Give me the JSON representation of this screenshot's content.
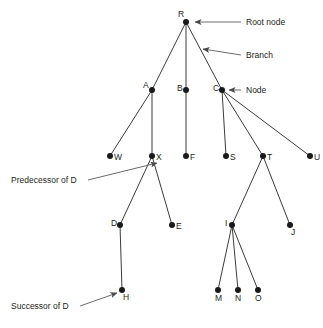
{
  "diagram": {
    "type": "tree",
    "colors": {
      "background": "#ffffff",
      "node": "#1a1a1a",
      "branch": "#3b3b3b",
      "leader": "#5a5a5a",
      "text": "#231f20"
    },
    "nodes": [
      {
        "id": "R",
        "label": "R",
        "x": 186,
        "y": 22,
        "label_dx": -8,
        "label_dy": -5,
        "role": "root"
      },
      {
        "id": "A",
        "label": "A",
        "x": 152,
        "y": 90,
        "label_dx": -9,
        "label_dy": -2,
        "role": "internal"
      },
      {
        "id": "B",
        "label": "B",
        "x": 186,
        "y": 90,
        "label_dx": -9,
        "label_dy": 1,
        "role": "internal"
      },
      {
        "id": "C",
        "label": "C",
        "x": 222,
        "y": 90,
        "label_dx": -9,
        "label_dy": 1,
        "role": "internal"
      },
      {
        "id": "W",
        "label": "W",
        "x": 110,
        "y": 156,
        "label_dx": 4,
        "label_dy": 4,
        "role": "leaf"
      },
      {
        "id": "X",
        "label": "X",
        "x": 152,
        "y": 156,
        "label_dx": 4,
        "label_dy": 4,
        "role": "internal"
      },
      {
        "id": "F",
        "label": "F",
        "x": 186,
        "y": 156,
        "label_dx": 4,
        "label_dy": 4,
        "role": "leaf"
      },
      {
        "id": "S",
        "label": "S",
        "x": 226,
        "y": 156,
        "label_dx": 4,
        "label_dy": 4,
        "role": "leaf"
      },
      {
        "id": "T",
        "label": "T",
        "x": 263,
        "y": 156,
        "label_dx": 4,
        "label_dy": 4,
        "role": "internal"
      },
      {
        "id": "U",
        "label": "U",
        "x": 310,
        "y": 156,
        "label_dx": 4,
        "label_dy": 4,
        "role": "leaf"
      },
      {
        "id": "D",
        "label": "D",
        "x": 120,
        "y": 225,
        "label_dx": -9,
        "label_dy": 1,
        "role": "internal"
      },
      {
        "id": "E",
        "label": "E",
        "x": 172,
        "y": 225,
        "label_dx": 4,
        "label_dy": 4,
        "role": "leaf"
      },
      {
        "id": "I",
        "label": "I",
        "x": 232,
        "y": 225,
        "label_dx": -7,
        "label_dy": 1,
        "role": "internal"
      },
      {
        "id": "J",
        "label": "J",
        "x": 290,
        "y": 225,
        "label_dx": 1,
        "label_dy": 10,
        "role": "leaf"
      },
      {
        "id": "H",
        "label": "H",
        "x": 122,
        "y": 290,
        "label_dx": 1,
        "label_dy": 10,
        "role": "leaf"
      },
      {
        "id": "M",
        "label": "M",
        "x": 218,
        "y": 290,
        "label_dx": -3,
        "label_dy": 11,
        "role": "leaf"
      },
      {
        "id": "N",
        "label": "N",
        "x": 238,
        "y": 290,
        "label_dx": -3,
        "label_dy": 11,
        "role": "leaf"
      },
      {
        "id": "O",
        "label": "O",
        "x": 258,
        "y": 290,
        "label_dx": -3,
        "label_dy": 11,
        "role": "leaf"
      }
    ],
    "edges": [
      {
        "from": "R",
        "to": "A"
      },
      {
        "from": "R",
        "to": "B"
      },
      {
        "from": "R",
        "to": "C"
      },
      {
        "from": "A",
        "to": "W"
      },
      {
        "from": "A",
        "to": "X"
      },
      {
        "from": "B",
        "to": "F"
      },
      {
        "from": "C",
        "to": "S"
      },
      {
        "from": "C",
        "to": "T"
      },
      {
        "from": "C",
        "to": "U"
      },
      {
        "from": "X",
        "to": "D"
      },
      {
        "from": "X",
        "to": "E"
      },
      {
        "from": "T",
        "to": "I"
      },
      {
        "from": "T",
        "to": "J"
      },
      {
        "from": "D",
        "to": "H"
      },
      {
        "from": "I",
        "to": "M"
      },
      {
        "from": "I",
        "to": "N"
      },
      {
        "from": "I",
        "to": "O"
      }
    ],
    "annotations": [
      {
        "id": "root-node",
        "text": "Root node",
        "text_x": 246,
        "text_y": 25,
        "anchor": "start",
        "leader": {
          "x1": 241,
          "y1": 22,
          "x2": 195,
          "y2": 22
        },
        "arrow": true
      },
      {
        "id": "branch",
        "text": "Branch",
        "text_x": 246,
        "text_y": 58,
        "anchor": "start",
        "leader": {
          "x1": 241,
          "y1": 55,
          "x2": 203,
          "y2": 49
        },
        "arrow": true
      },
      {
        "id": "node",
        "text": "Node",
        "text_x": 246,
        "text_y": 93,
        "anchor": "start",
        "leader": {
          "x1": 241,
          "y1": 90,
          "x2": 229,
          "y2": 90
        },
        "arrow": true
      },
      {
        "id": "predecessor-of-d",
        "text": "Predecessor of D",
        "text_x": 11,
        "text_y": 183,
        "anchor": "start",
        "leader": {
          "x1": 88,
          "y1": 180,
          "x2": 157,
          "y2": 163
        },
        "arrow": true
      },
      {
        "id": "successor-of-d",
        "text": "Successor of D",
        "text_x": 11,
        "text_y": 309,
        "anchor": "start",
        "leader": {
          "x1": 80,
          "y1": 306,
          "x2": 117,
          "y2": 293
        },
        "arrow": true
      }
    ]
  }
}
